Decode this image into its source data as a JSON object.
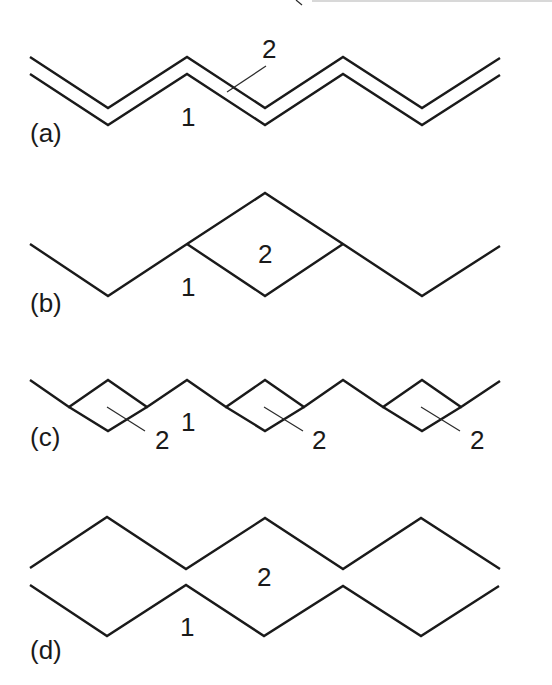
{
  "figure": {
    "panels": [
      {
        "id": "a",
        "label": "(a)",
        "description": "Two parallel zigzag lines (double line) — 1 and 2 in parallel contact",
        "part_labels": [
          "1",
          "2"
        ]
      },
      {
        "id": "b",
        "label": "(b)",
        "description": "Single zigzag with one diamond-shaped loop (2) attached to chain 1",
        "part_labels": [
          "1",
          "2"
        ]
      },
      {
        "id": "c",
        "label": "(c)",
        "description": "Zigzag chain 1 with three small diamond loops 2 embedded along it",
        "part_labels": [
          "1",
          "2",
          "2",
          "2"
        ]
      },
      {
        "id": "d",
        "label": "(d)",
        "description": "Two zigzag chains touching at vertices, enclosing regions labelled 2",
        "part_labels": [
          "1",
          "2"
        ]
      }
    ],
    "labels": {
      "a_one": "1",
      "a_two": "2",
      "b_one": "1",
      "b_two": "2",
      "c_one": "1",
      "c_two_1": "2",
      "c_two_2": "2",
      "c_two_3": "2",
      "d_one": "1",
      "d_two": "2",
      "a_panel": "(a)",
      "b_panel": "(b)",
      "c_panel": "(c)",
      "d_panel": "(d)"
    },
    "colors": {
      "line": "#1a1a1a",
      "background": "#ffffff"
    }
  }
}
